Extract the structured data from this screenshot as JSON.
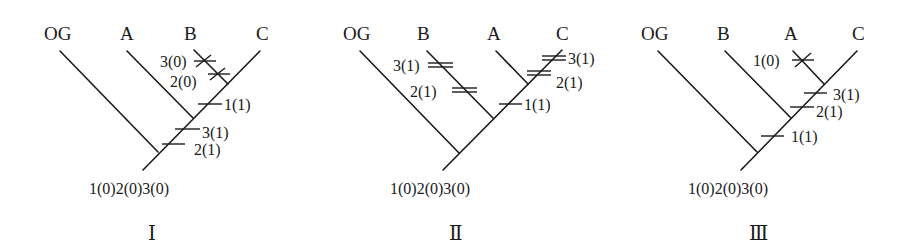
{
  "figure": {
    "trees": [
      {
        "id": "I",
        "roman_label": "Ⅰ",
        "taxa": [
          "OG",
          "A",
          "B",
          "C"
        ],
        "root_states": "1(0)2(0)3(0)",
        "marks": {
          "b_3_0": "3(0)",
          "b_2_0": "2(0)",
          "c_1_1": "1(1)",
          "stem_3_1": "3(1)",
          "stem_2_1": "2(1)"
        }
      },
      {
        "id": "II",
        "roman_label": "Ⅱ",
        "taxa": [
          "OG",
          "B",
          "A",
          "C"
        ],
        "root_states": "1(0)2(0)3(0)",
        "marks": {
          "b_3_1": "3(1)",
          "b_2_1": "2(1)",
          "c_3_1": "3(1)",
          "c_2_1": "2(1)",
          "stem_1_1": "1(1)"
        }
      },
      {
        "id": "III",
        "roman_label": "Ⅲ",
        "taxa": [
          "OG",
          "B",
          "A",
          "C"
        ],
        "root_states": "1(0)2(0)3(0)",
        "marks": {
          "a_1_0": "1(0)",
          "ac_3_1": "3(1)",
          "abc_2_1": "2(1)",
          "stem_1_1": "1(1)"
        }
      }
    ],
    "legend": {
      "single_bar": "single character change",
      "double_bar": "parallel/convergent change",
      "cross": "reversal"
    }
  }
}
